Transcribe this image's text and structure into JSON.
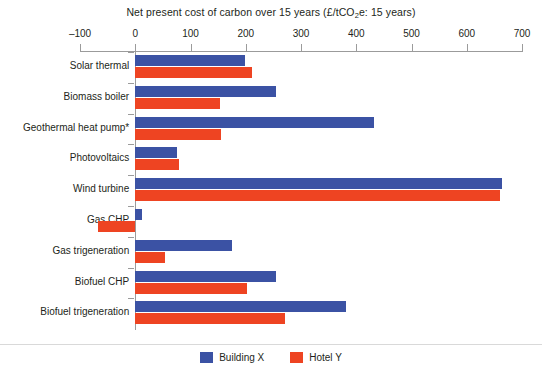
{
  "chart_data": {
    "type": "bar",
    "orientation": "horizontal",
    "title": "Net present cost of carbon over 15 years (£/tCO2e: 15 years)",
    "title_parts": {
      "before_sub": "Net present cost of carbon over 15 years (£/tCO",
      "sub": "2",
      "after_sub": "e: 15 years)"
    },
    "xlabel": "",
    "ylabel": "",
    "xlim": [
      -100,
      700
    ],
    "xticks": [
      -100,
      0,
      100,
      200,
      300,
      400,
      500,
      600,
      700
    ],
    "xtick_labels": [
      "–100",
      "0",
      "100",
      "200",
      "300",
      "400",
      "500",
      "600",
      "700"
    ],
    "grid": false,
    "legend_position": "bottom-center",
    "categories": [
      "Solar thermal",
      "Biomass boiler",
      "Geothermal heat pump*",
      "Photovoltaics",
      "Wind turbine",
      "Gas CHP",
      "Gas trigeneration",
      "Biofuel CHP",
      "Biofuel trigeneration"
    ],
    "series": [
      {
        "name": "Building X",
        "color": "#3b52a4",
        "values": [
          199,
          255,
          433,
          76,
          664,
          12,
          175,
          255,
          382
        ]
      },
      {
        "name": "Hotel Y",
        "color": "#ee4422",
        "values": [
          211,
          153,
          155,
          79,
          661,
          -68,
          53,
          202,
          271
        ]
      }
    ],
    "annotations": [
      "* Geothermal heat pump value marked with asterisk"
    ]
  },
  "legend": {
    "items": [
      {
        "label": "Building X",
        "color": "#3b52a4"
      },
      {
        "label": "Hotel Y",
        "color": "#ee4422"
      }
    ]
  }
}
